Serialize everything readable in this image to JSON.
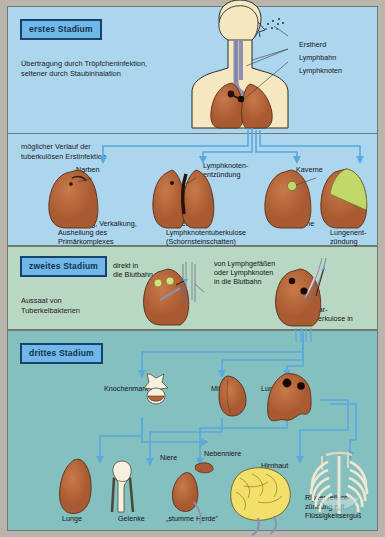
{
  "stages": {
    "stage1": {
      "badge": "erstes Stadium",
      "note": "Übertragung durch Tröpfcheninfektion,\nseltener durch Staubinhalation",
      "callouts": [
        {
          "label": "Erstherd"
        },
        {
          "label": "Lymphbahn"
        },
        {
          "label": "Lymphknoten"
        }
      ]
    },
    "stage2": {
      "note": "möglicher Verlauf der\ntuberkulösen Erstinfektion",
      "outcomes": [
        {
          "label": "Narben",
          "caption": "Vernarbung, Verkalkung,\nAusheilung des\nPrimärkomplexes"
        },
        {
          "label": "Lymphknoten-\nentzündung",
          "caption": "ausgedehnte\nLymphknotentuberkulose\n(Schornsteinschatten)"
        },
        {
          "label": "Kaverne",
          "caption": "Frühkaverne"
        },
        {
          "label": "",
          "caption": "käsige\nLungenent-\nzündung"
        }
      ]
    },
    "stage3": {
      "badge": "zweites Stadium",
      "note": "Aussaat von\nTuberkelbakterien",
      "routes": [
        {
          "label": "direkt in\ndie Blutbahn"
        },
        {
          "label": "von Lymphgefäßen\noder Lymphknoten\nin die Blutbahn"
        }
      ],
      "result": "Miliar-\ntuberkulose in"
    },
    "stage4": {
      "badge": "drittes Stadium",
      "organs_top": [
        {
          "label": "Knochenmark"
        },
        {
          "label": "Milz"
        },
        {
          "label": "Lunge"
        }
      ],
      "organs_mid": [
        {
          "label": "Niere"
        },
        {
          "label": "Nebenniere"
        },
        {
          "label": "Hirnhaut"
        }
      ],
      "organs_bottom": [
        {
          "label": "Lunge"
        },
        {
          "label": "Gelenke"
        },
        {
          "label": "„stumme Herde\""
        }
      ],
      "pleura_caption": "Rippenfellent-\nzündung mit\nFlüssigkeitserguß"
    }
  },
  "colors": {
    "stage1_bg": "#abd6ee",
    "stage3_bg": "#b9d8c4",
    "stage4_bg": "#84c0c0",
    "badge_bg": "#6fb8e8",
    "badge_border": "#17426e",
    "organ": "#b5653a",
    "lung": "#b5653a",
    "skin": "#f5e7bf",
    "caverne": "#c2d96a",
    "brain": "#f2e06a",
    "bone": "#f6f1dc",
    "arrow": "#5aa8dc"
  }
}
